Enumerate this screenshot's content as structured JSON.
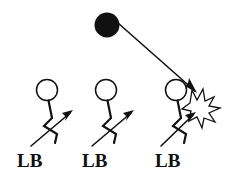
{
  "diagram": {
    "background_color": "#ffffff",
    "ink_color": "#111111",
    "ball": {
      "name": "football",
      "fill": "#111111",
      "cx": 107,
      "cy": 25,
      "r": 12.5
    },
    "trajectory": {
      "name": "ball-flight-path",
      "label": "",
      "from_x": 118,
      "from_y": 23,
      "to_x": 196,
      "to_y": 92,
      "color": "#111111"
    },
    "impact": {
      "name": "collision-starburst",
      "fill": "#ffffff",
      "stroke": "#111111",
      "cx": 202,
      "cy": 104
    },
    "players": [
      {
        "label": "LB",
        "head_cx": 47,
        "head_cy": 90,
        "head_r": 10.5,
        "label_x": 17,
        "label_y": 167,
        "arrow_from_x": 31,
        "arrow_from_y": 146,
        "arrow_to_x": 73,
        "arrow_to_y": 110
      },
      {
        "label": "LB",
        "head_cx": 106,
        "head_cy": 90,
        "head_r": 10.5,
        "label_x": 82,
        "label_y": 167,
        "arrow_from_x": 92,
        "arrow_from_y": 146,
        "arrow_to_x": 134,
        "arrow_to_y": 110
      },
      {
        "label": "LB",
        "head_cx": 176,
        "head_cy": 90,
        "head_r": 10.5,
        "label_x": 155,
        "label_y": 167,
        "arrow_from_x": 161,
        "arrow_from_y": 146,
        "arrow_to_x": 196,
        "arrow_to_y": 112
      }
    ]
  }
}
